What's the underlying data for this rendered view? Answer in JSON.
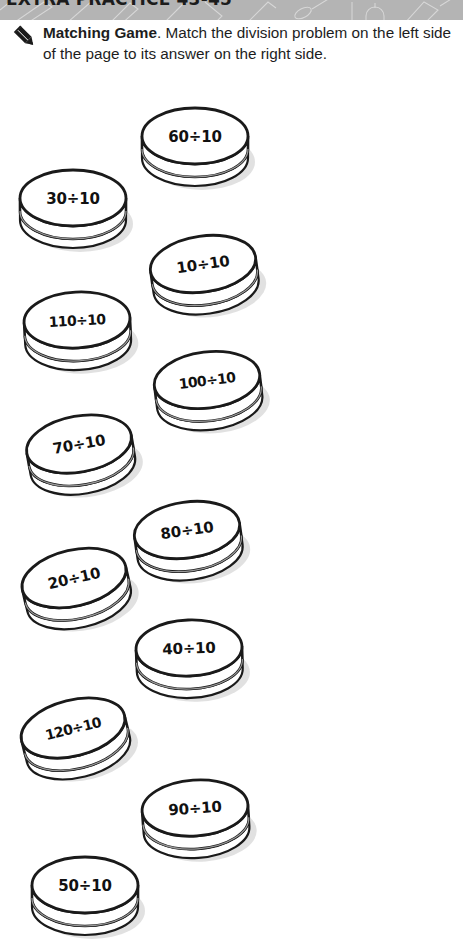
{
  "header": {
    "band_color": "#b4b4b4",
    "cut_off_title": "EXTRA PRACTICE 43-45",
    "doodle_icon_names": [
      "ruler-doodle",
      "pencil-doodle",
      "scissors-doodle",
      "paint-brush-doodle",
      "bell-doodle",
      "book-doodle"
    ]
  },
  "instruction": {
    "icon": "pencil-icon",
    "lead": "Matching Game",
    "body": ". Match the division problem on the left side of the page to its answer on the right side."
  },
  "coins": [
    {
      "label": "60÷10",
      "x": 134,
      "y": 96,
      "rot": 0,
      "side": "right"
    },
    {
      "label": "30÷10",
      "x": 12,
      "y": 158,
      "rot": 0,
      "side": "left"
    },
    {
      "label": "10÷10",
      "x": 142,
      "y": 224,
      "rot": -8,
      "side": "right"
    },
    {
      "label": "110÷10",
      "x": 16,
      "y": 280,
      "rot": -3,
      "side": "left"
    },
    {
      "label": "100÷10",
      "x": 146,
      "y": 340,
      "rot": -7,
      "side": "right"
    },
    {
      "label": "70÷10",
      "x": 18,
      "y": 404,
      "rot": -10,
      "side": "left"
    },
    {
      "label": "80÷10",
      "x": 126,
      "y": 490,
      "rot": -8,
      "side": "right"
    },
    {
      "label": "20÷10",
      "x": 13,
      "y": 538,
      "rot": -13,
      "side": "left"
    },
    {
      "label": "40÷10",
      "x": 128,
      "y": 608,
      "rot": -2,
      "side": "right"
    },
    {
      "label": "120÷10",
      "x": 12,
      "y": 688,
      "rot": -14,
      "side": "left"
    },
    {
      "label": "90÷10",
      "x": 134,
      "y": 768,
      "rot": -4,
      "side": "right"
    },
    {
      "label": "50÷10",
      "x": 24,
      "y": 845,
      "rot": 0,
      "side": "left"
    }
  ]
}
